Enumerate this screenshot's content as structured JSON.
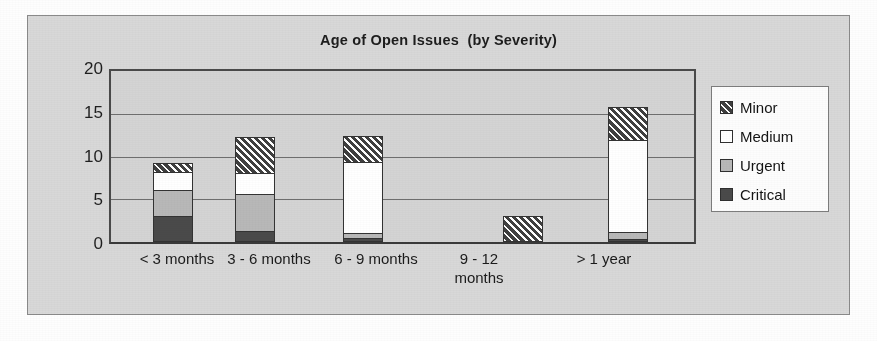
{
  "chart_data": {
    "type": "bar",
    "subtype": "stacked-column",
    "title": "Age of Open Issues  (by Severity)",
    "xlabel": "",
    "ylabel": "",
    "categories": [
      "< 3 months",
      "3 - 6 months",
      "6 - 9 months",
      "9 - 12\nmonths",
      "> 1 year"
    ],
    "series": [
      {
        "name": "Critical",
        "values": [
          3,
          1.3,
          0.5,
          0,
          0.4
        ]
      },
      {
        "name": "Urgent",
        "values": [
          3,
          4.2,
          0.5,
          0,
          0.7
        ]
      },
      {
        "name": "Medium",
        "values": [
          2,
          2.4,
          8.2,
          0,
          10.6
        ]
      },
      {
        "name": "Minor",
        "values": [
          1,
          4.1,
          2.9,
          3,
          3.7
        ]
      }
    ],
    "totals": [
      9,
      12,
      12.1,
      3,
      15.4
    ],
    "yticks": [
      0,
      5,
      10,
      15,
      20
    ],
    "ylim": [
      0,
      20
    ],
    "grid": true,
    "legend_position": "right",
    "legend_order": [
      "Minor",
      "Medium",
      "Urgent",
      "Critical"
    ],
    "colors": {
      "critical": "#4a4a4a",
      "urgent": "#b8b8b8",
      "medium": "#ffffff",
      "minor": "#3f3f3f",
      "plot_background": "#d4d4d4",
      "frame_background": "#d8d8d8",
      "axis": "#3a3a3a",
      "gridline": "#6e6e6e"
    }
  },
  "legend": {
    "items": [
      {
        "label": "Minor",
        "swatch": "minor-swatch"
      },
      {
        "label": "Medium",
        "swatch": "medium-swatch"
      },
      {
        "label": "Urgent",
        "swatch": "urgent-swatch"
      },
      {
        "label": "Critical",
        "swatch": "critical-swatch"
      }
    ]
  }
}
